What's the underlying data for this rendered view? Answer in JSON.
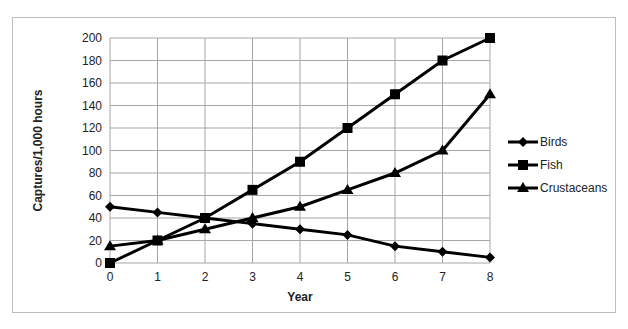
{
  "chart_data": {
    "type": "line",
    "title": "",
    "xlabel": "Year",
    "ylabel": "Captures/1,000 hours",
    "x": [
      0,
      1,
      2,
      3,
      4,
      5,
      6,
      7,
      8
    ],
    "ylim": [
      0,
      200
    ],
    "yticks": [
      0,
      20,
      40,
      60,
      80,
      100,
      120,
      140,
      160,
      180,
      200
    ],
    "grid": true,
    "legend_position": "right",
    "series": [
      {
        "name": "Birds",
        "marker": "diamond",
        "values": [
          50,
          45,
          40,
          35,
          30,
          25,
          15,
          10,
          5
        ]
      },
      {
        "name": "Fish",
        "marker": "square",
        "values": [
          0,
          20,
          40,
          65,
          90,
          120,
          150,
          180,
          200
        ]
      },
      {
        "name": "Crustaceans",
        "marker": "triangle",
        "values": [
          15,
          20,
          30,
          40,
          50,
          65,
          80,
          100,
          150
        ]
      }
    ]
  },
  "colors": {
    "line": "#000000",
    "grid": "#a6a6a6",
    "frame": "#bdbdbd"
  }
}
